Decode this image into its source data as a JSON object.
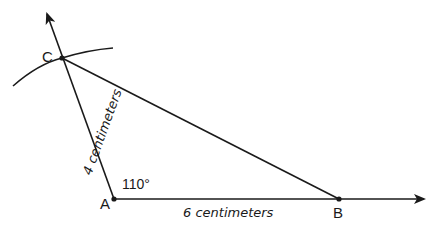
{
  "diagram": {
    "type": "geometric-construction",
    "points": {
      "A": {
        "label": "A",
        "x": 114,
        "y": 199
      },
      "B": {
        "label": "B",
        "x": 339,
        "y": 199
      },
      "C": {
        "label": "C",
        "x": 62,
        "y": 58
      }
    },
    "angle_label": "110°",
    "side_AB_label": "6 centimeters",
    "side_AC_label": "4 centimeters",
    "colors": {
      "stroke": "#1a1a1a",
      "background": "#ffffff"
    }
  }
}
